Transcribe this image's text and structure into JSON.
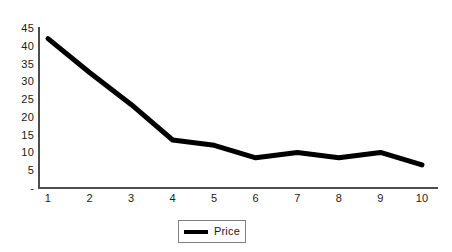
{
  "chart_data": {
    "type": "line",
    "title": "",
    "xlabel": "",
    "ylabel": "",
    "categories": [
      "1",
      "2",
      "3",
      "4",
      "5",
      "6",
      "7",
      "8",
      "9",
      "10"
    ],
    "x": [
      1,
      2,
      3,
      4,
      5,
      6,
      7,
      8,
      9,
      10
    ],
    "series": [
      {
        "name": "Price",
        "color": "#000000",
        "values": [
          42,
          32.5,
          23.5,
          13.5,
          12,
          8.5,
          10,
          8.5,
          10,
          6.5
        ]
      }
    ],
    "ylim": [
      0,
      45
    ],
    "xlim": [
      1,
      10
    ],
    "y_ticks": [
      45,
      40,
      35,
      30,
      25,
      20,
      15,
      10,
      5,
      0
    ],
    "y_tick_labels": [
      "45",
      "40",
      "35",
      "30",
      "25",
      "20",
      "15",
      "10",
      "5",
      "-"
    ],
    "x_tick_labels": [
      "1",
      "2",
      "3",
      "4",
      "5",
      "6",
      "7",
      "8",
      "9",
      "10"
    ],
    "grid": false,
    "legend_position": "bottom"
  },
  "legend": {
    "entries": [
      {
        "label": "Price",
        "color": "#000000"
      }
    ]
  },
  "axes": {
    "axis_color": "#4d4d4d",
    "label_color": "#1a1a1a"
  }
}
